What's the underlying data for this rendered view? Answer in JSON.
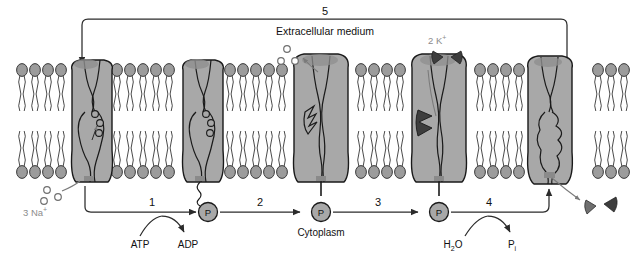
{
  "figure": {
    "title_region": "Na+/K+ ATPase pump cycle across a phospholipid bilayer membrane",
    "compartments": {
      "extracellular_label": "Extracellular medium",
      "cytoplasm_label": "Cytoplasm"
    },
    "colors": {
      "protein_fill": "#a8a8a8",
      "protein_stroke": "#1a1a1a",
      "lipid_head_fill": "#9c9c9c",
      "lipid_stroke": "#2b2b2b",
      "ion_k_fill": "#3d3d3d",
      "ion_na_stroke": "#6f6f6f",
      "phosphate_fill": "#a8a8a8",
      "gray_text": "#8c8c8c",
      "black_text": "#111111",
      "arrow_stroke": "#2b2b2b",
      "background": "#ffffff"
    },
    "steps": [
      {
        "number": "1",
        "cofactor_in": "ATP",
        "cofactor_out": "ADP"
      },
      {
        "number": "2",
        "cofactor_in": "",
        "cofactor_out": ""
      },
      {
        "number": "3",
        "cofactor_in": "",
        "cofactor_out": ""
      },
      {
        "number": "4",
        "cofactor_in": "H2O",
        "cofactor_out": "Pi"
      },
      {
        "number": "5",
        "cofactor_in": "",
        "cofactor_out": ""
      }
    ],
    "step_labels": {
      "s1": "1",
      "s2": "2",
      "s3": "3",
      "s4": "4",
      "s5": "5"
    },
    "ion_labels": {
      "sodium": "3 Na",
      "sodium_charge": "+",
      "potassium": "2 K",
      "potassium_charge": "+"
    },
    "cofactor_labels": {
      "atp": "ATP",
      "adp": "ADP",
      "water": "H",
      "water_sub": "2",
      "water_tail": "O",
      "phosphate_free": "P",
      "phosphate_free_sub": "i"
    },
    "phosphate_marker": "P",
    "pumps": [
      {
        "id": "pump-1",
        "state": "inward-open, 3 Na+ bound, receiving step 5 recycle arrow",
        "bound_ions": "3 Na+"
      },
      {
        "id": "pump-2",
        "state": "occluded, phosphorylated, 3 Na+ bound",
        "bound_ions": "3 Na+"
      },
      {
        "id": "pump-3",
        "state": "outward-open, releasing 3 Na+ to extracellular medium",
        "bound_ions": "none"
      },
      {
        "id": "pump-4",
        "state": "outward-open, binding 2 K+ from extracellular medium",
        "bound_ions": "2 K+"
      },
      {
        "id": "pump-5",
        "state": "inward-open, releasing 2 K+ to cytoplasm",
        "bound_ions": "none"
      }
    ]
  }
}
